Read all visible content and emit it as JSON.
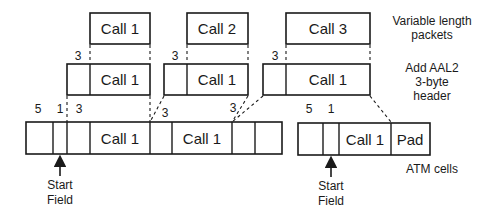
{
  "diagram": {
    "rows": {
      "packets": {
        "label_line1": "Variable length",
        "label_line2": "packets",
        "items": [
          "Call 1",
          "Call 2",
          "Call 3"
        ]
      },
      "aal2": {
        "label_line1": "Add AAL2",
        "label_line2": "3-byte",
        "label_line3": "header",
        "header_size": "3",
        "items": [
          "Call 1",
          "Call 1",
          "Call 1"
        ]
      },
      "atm": {
        "label": "ATM cells",
        "cell1": {
          "field_sizes": [
            "5",
            "1",
            "3",
            "3",
            "3"
          ],
          "payloads": [
            "Call 1",
            "Call 1"
          ]
        },
        "cell2": {
          "field_sizes": [
            "5",
            "1"
          ],
          "payload": "Call 1",
          "pad": "Pad"
        }
      }
    },
    "annotations": {
      "start_field_line1": "Start",
      "start_field_line2": "Field"
    },
    "colors": {
      "stroke": "#1a1a1a",
      "background": "#ffffff"
    }
  }
}
